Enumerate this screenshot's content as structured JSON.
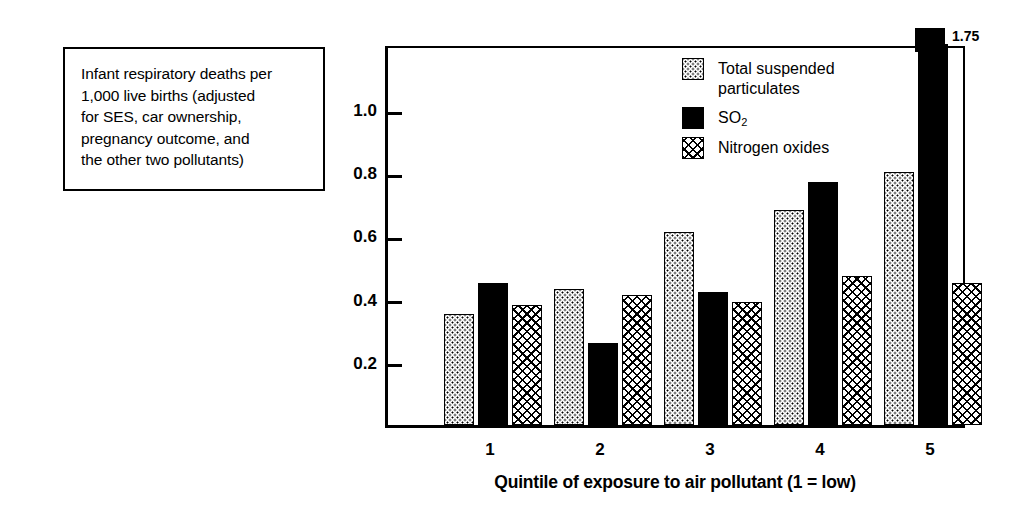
{
  "caption": {
    "text": "Infant respiratory deaths per\n1,000 live births (adjusted\nfor SES, car ownership,\npregnancy outcome, and\nthe other two pollutants)"
  },
  "chart_data": {
    "type": "bar",
    "title": "",
    "xlabel": "Quintile of exposure to air pollutant (1 = low)",
    "ylabel": "",
    "categories": [
      "1",
      "2",
      "3",
      "4",
      "5"
    ],
    "ylim": [
      0,
      1.2
    ],
    "yticks": [
      "0.2",
      "0.4",
      "0.6",
      "0.8",
      "1.0"
    ],
    "ytick_values": [
      0.2,
      0.4,
      0.6,
      0.8,
      1.0
    ],
    "grid": false,
    "legend_position": "inside-top-center",
    "series": [
      {
        "name": "Total suspended particulates",
        "pattern": "dotted",
        "values": [
          0.35,
          0.43,
          0.61,
          0.68,
          0.8
        ]
      },
      {
        "name": "SO2",
        "name_display": "SO",
        "name_subscript": "2",
        "pattern": "solid-black",
        "values": [
          0.45,
          0.26,
          0.42,
          0.77,
          1.75
        ]
      },
      {
        "name": "Nitrogen oxides",
        "pattern": "crosshatch",
        "values": [
          0.38,
          0.41,
          0.39,
          0.47,
          0.45
        ]
      }
    ],
    "annotations": [
      {
        "text": "1.75",
        "series": "SO2",
        "category": "5",
        "note": "value label for bar that extends beyond the plot area"
      }
    ]
  },
  "legend": {
    "items": [
      {
        "label": "Total suspended\nparticulates",
        "pattern": "dotted"
      },
      {
        "label": "SO",
        "subscript": "2",
        "pattern": "solid-black"
      },
      {
        "label": "Nitrogen oxides",
        "pattern": "crosshatch"
      }
    ]
  }
}
